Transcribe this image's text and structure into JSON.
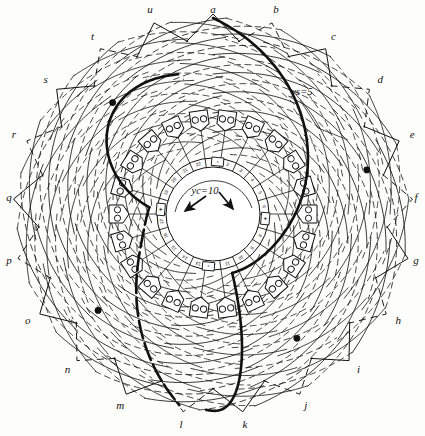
{
  "figure": {
    "type": "winding-diagram",
    "background_color": "#fdfdfc",
    "ink_color": "#111111"
  },
  "annotations": {
    "commutator_pitch": {
      "symbol": "y",
      "subscript": "c",
      "equals": "=",
      "value": "10",
      "text": "yc=10"
    },
    "coil_span": {
      "symbol": "y",
      "subscript": "s",
      "equals": "=",
      "value": "5",
      "text": "ys=5"
    }
  },
  "brushes": [
    {
      "polarity": "+",
      "near_segment": "1",
      "angle_deg": 185
    },
    {
      "polarity": "-",
      "near_segment": "6",
      "angle_deg": 275
    },
    {
      "polarity": "+",
      "near_segment": "11",
      "angle_deg": 5
    },
    {
      "polarity": "-",
      "near_segment": "17",
      "angle_deg": 95
    }
  ],
  "commutator": {
    "segment_count": 22,
    "segments": [
      "1",
      "2",
      "3",
      "4",
      "5",
      "6",
      "7",
      "8",
      "9",
      "10",
      "11",
      "12",
      "13",
      "14",
      "15",
      "16",
      "17",
      "18",
      "19",
      "20",
      "21",
      "22"
    ]
  },
  "terminals": {
    "count": 21,
    "labels": [
      "a",
      "b",
      "c",
      "d",
      "e",
      "f",
      "g",
      "h",
      "i",
      "j",
      "k",
      "l",
      "m",
      "n",
      "o",
      "p",
      "q",
      "r",
      "s",
      "t",
      "u"
    ]
  },
  "slots": {
    "count": 22,
    "conductors_per_slot": 2
  },
  "highlighted_paths": {
    "count": 2,
    "node_markers": 4,
    "description": "two traced coil circuits drawn in heavy line"
  }
}
